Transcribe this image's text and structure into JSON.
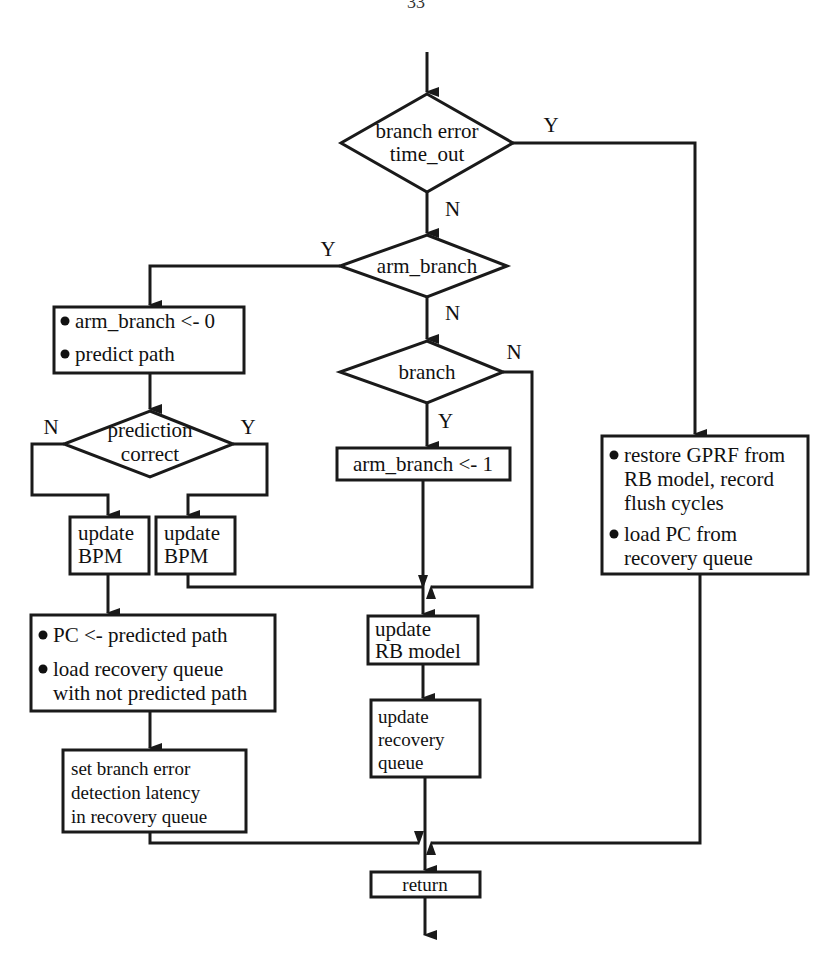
{
  "page": {
    "number": "33"
  },
  "decisions": {
    "timeout": {
      "lines": [
        "branch error",
        "time_out"
      ],
      "yes": "Y",
      "no": "N"
    },
    "arm_branch": {
      "lines": [
        "arm_branch"
      ],
      "yes": "Y",
      "no": "N"
    },
    "branch": {
      "lines": [
        "branch"
      ],
      "yes": "Y",
      "no": "N"
    },
    "prediction": {
      "lines": [
        "prediction",
        "correct"
      ],
      "yes": "Y",
      "no": "N"
    }
  },
  "processes": {
    "arm_predict": {
      "bullets": [
        "arm_branch <- 0",
        "predict path"
      ]
    },
    "set_arm": {
      "lines": [
        "arm_branch <- 1"
      ]
    },
    "restore": {
      "bullets": [
        [
          "restore GPRF from",
          "RB model, record",
          "flush cycles"
        ],
        [
          "load PC from",
          "recovery queue"
        ]
      ]
    },
    "update_bpm_n": {
      "lines": [
        "update",
        "BPM"
      ]
    },
    "update_bpm_y": {
      "lines": [
        "update",
        "BPM"
      ]
    },
    "pc_load": {
      "bullets": [
        [
          "PC <- predicted path"
        ],
        [
          "load recovery queue",
          "with not predicted path"
        ]
      ]
    },
    "set_latency": {
      "lines": [
        "set branch error",
        "detection latency",
        "in recovery queue"
      ]
    },
    "update_rb": {
      "lines": [
        "update",
        "RB model"
      ]
    },
    "update_rq": {
      "lines": [
        "update",
        "recovery",
        "queue"
      ]
    },
    "return": {
      "lines": [
        "return"
      ]
    }
  }
}
